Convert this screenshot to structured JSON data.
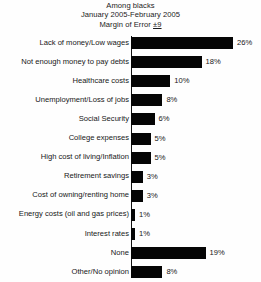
{
  "chart_data": {
    "type": "bar",
    "orientation": "horizontal",
    "title": "Among blacks",
    "subtitle": "January 2005-February 2005",
    "margin_of_error_prefix": "Margin of Error ",
    "margin_of_error_value": "±9",
    "xlabel": "",
    "ylabel": "",
    "xlim": [
      0,
      26
    ],
    "grid": false,
    "legend": false,
    "value_suffix": "%",
    "bar_color": "#050505",
    "categories": [
      "Lack of money/Low wages",
      "Not enough money to pay debts",
      "Healthcare costs",
      "Unemployment/Loss of jobs",
      "Social Security",
      "College expenses",
      "High cost of living/Inflation",
      "Retirement savings",
      "Cost of owning/renting home",
      "Energy costs (oil and gas prices)",
      "Interest rates",
      "None",
      "Other/No opinion"
    ],
    "values": [
      26,
      18,
      10,
      8,
      6,
      5,
      5,
      3,
      3,
      1,
      1,
      19,
      8
    ],
    "value_labels": [
      "26%",
      "18%",
      "10%",
      "8%",
      "6%",
      "5%",
      "5%",
      "3%",
      "3%",
      "1%",
      "1%",
      "19%",
      "8%"
    ]
  }
}
